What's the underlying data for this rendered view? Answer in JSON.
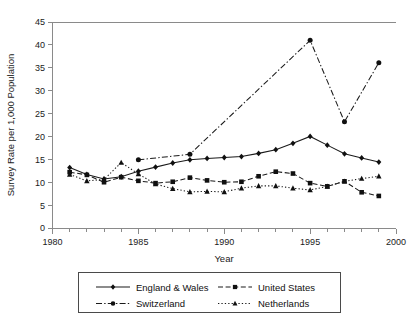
{
  "chart_data": {
    "type": "line",
    "title": "",
    "xlabel": "Year",
    "ylabel": "Survey Rate per 1,000 Population",
    "xlim": [
      1980,
      2000
    ],
    "ylim": [
      0,
      45
    ],
    "ytick_step": 5,
    "xtick_step": 5,
    "x_minor_tick_step": 1,
    "grid": false,
    "legend_position": "bottom",
    "yticks": [
      "0",
      "5",
      "10",
      "15",
      "20",
      "25",
      "30",
      "35",
      "40",
      "45"
    ],
    "xticks": [
      "1980",
      "1985",
      "1990",
      "1995",
      "2000"
    ],
    "series": [
      {
        "name": "England & Wales",
        "marker": "diamond",
        "dash": "solid",
        "x": [
          1981,
          1982,
          1983,
          1984,
          1985,
          1986,
          1987,
          1988,
          1989,
          1990,
          1991,
          1992,
          1993,
          1994,
          1995,
          1996,
          1997,
          1998,
          1999
        ],
        "values": [
          13.2,
          11.7,
          10.7,
          11.2,
          12.4,
          13.3,
          14.2,
          14.9,
          15.2,
          15.4,
          15.6,
          16.3,
          17.1,
          18.5,
          20.0,
          18.1,
          16.2,
          15.3,
          14.4
        ]
      },
      {
        "name": "United States",
        "marker": "square",
        "dash": "dashed",
        "x": [
          1981,
          1982,
          1983,
          1984,
          1985,
          1986,
          1987,
          1988,
          1989,
          1990,
          1991,
          1992,
          1993,
          1994,
          1995,
          1996,
          1997,
          1998,
          1999
        ],
        "values": [
          12.2,
          11.6,
          10.0,
          11.1,
          10.3,
          9.8,
          10.1,
          11.0,
          10.4,
          10.0,
          10.1,
          11.3,
          12.3,
          11.9,
          9.8,
          9.1,
          10.2,
          7.8,
          7.0
        ]
      },
      {
        "name": "Switzerland",
        "marker": "circle",
        "dash": "dashdot",
        "x": [
          1985,
          1988,
          1995,
          1997,
          1999
        ],
        "values": [
          14.9,
          16.1,
          41.0,
          23.2,
          36.1
        ]
      },
      {
        "name": "Netherlands",
        "marker": "triangle",
        "dash": "dotted",
        "x": [
          1981,
          1982,
          1983,
          1984,
          1985,
          1986,
          1987,
          1988,
          1989,
          1990,
          1991,
          1992,
          1993,
          1994,
          1995,
          1996,
          1997,
          1998,
          1999
        ],
        "values": [
          11.7,
          10.3,
          10.6,
          14.3,
          11.8,
          9.6,
          8.6,
          7.9,
          8.0,
          7.9,
          8.7,
          9.2,
          9.2,
          8.7,
          8.3,
          9.1,
          10.2,
          10.8,
          11.3
        ]
      }
    ]
  },
  "legend": {
    "entries": [
      {
        "label": "England & Wales"
      },
      {
        "label": "United States"
      },
      {
        "label": "Switzerland"
      },
      {
        "label": "Netherlands"
      }
    ]
  }
}
